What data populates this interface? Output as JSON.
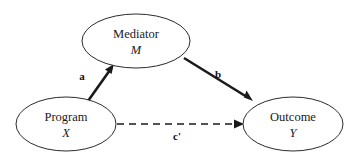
{
  "diagram": {
    "background_color": "#ffffff",
    "stroke_color": "#1a1a1a",
    "nodes": [
      {
        "id": "mediator",
        "name": "Mediator",
        "variable": "M",
        "shape": "ellipse",
        "cx": 136,
        "cy": 41,
        "rx": 54,
        "ry": 27
      },
      {
        "id": "program",
        "name": "Program",
        "variable": "X",
        "shape": "ellipse",
        "cx": 66,
        "cy": 124,
        "rx": 50,
        "ry": 27
      },
      {
        "id": "outcome",
        "name": "Outcome",
        "variable": "Y",
        "shape": "ellipse",
        "cx": 293,
        "cy": 124,
        "rx": 50,
        "ry": 27
      }
    ],
    "paths": [
      {
        "id": "path-a",
        "label": "a",
        "from": "program",
        "to": "mediator",
        "style": "solid",
        "label_x": 82,
        "label_y": 80
      },
      {
        "id": "path-b",
        "label": "b",
        "from": "mediator",
        "to": "outcome",
        "style": "solid",
        "label_x": 218,
        "label_y": 78
      },
      {
        "id": "path-c-prime",
        "label": "c'",
        "from": "program",
        "to": "outcome",
        "style": "dashed",
        "label_x": 177,
        "label_y": 140
      }
    ]
  }
}
